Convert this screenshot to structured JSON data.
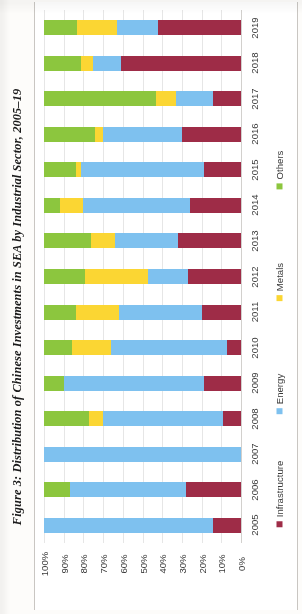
{
  "caption": "Figure 3: Distribution of Chinese Investments in SEA by Industrial Sector, 2005–19",
  "legend": {
    "position": "right-rotated",
    "items": [
      {
        "label": "Others",
        "color": "#8CC63E",
        "icon": "legend-swatch"
      },
      {
        "label": "Metals",
        "color": "#FBD633",
        "icon": "legend-swatch"
      },
      {
        "label": "Energy",
        "color": "#7EC1EF",
        "icon": "legend-swatch"
      },
      {
        "label": "Infrastructure",
        "color": "#9E2C47",
        "icon": "legend-swatch"
      }
    ]
  },
  "axis": {
    "percent_ticks": [
      "100%",
      "90%",
      "80%",
      "70%",
      "60%",
      "50%",
      "40%",
      "30%",
      "20%",
      "10%",
      "0%"
    ],
    "years": [
      "2019",
      "2018",
      "2017",
      "2016",
      "2015",
      "2014",
      "2013",
      "2012",
      "2011",
      "2010",
      "2009",
      "2008",
      "2007",
      "2006",
      "2005"
    ]
  },
  "chart_data": {
    "type": "bar",
    "orientation": "horizontal-stacked-100",
    "title": "Figure 3: Distribution of Chinese Investments in SEA by Industrial Sector, 2005–19",
    "xlabel": "",
    "ylabel": "",
    "xlim": [
      0,
      100
    ],
    "xtick_labels": [
      "100%",
      "90%",
      "80%",
      "70%",
      "60%",
      "50%",
      "40%",
      "30%",
      "20%",
      "10%",
      "0%"
    ],
    "x_axis_direction": "reversed (100% at left, 0% at right)",
    "grid": true,
    "legend_position": "right",
    "categories": [
      "2019",
      "2018",
      "2017",
      "2016",
      "2015",
      "2014",
      "2013",
      "2012",
      "2011",
      "2010",
      "2009",
      "2008",
      "2007",
      "2006",
      "2005"
    ],
    "series": [
      {
        "name": "Others",
        "color": "#8CC63E",
        "values": [
          17,
          19,
          57,
          26,
          16,
          8,
          24,
          21,
          16,
          14,
          10,
          23,
          0,
          13,
          0
        ]
      },
      {
        "name": "Metals",
        "color": "#FBD633",
        "values": [
          20,
          6,
          10,
          4,
          3,
          12,
          12,
          32,
          22,
          20,
          0,
          7,
          0,
          0,
          0
        ]
      },
      {
        "name": "Energy",
        "color": "#7EC1EF",
        "values": [
          21,
          14,
          19,
          40,
          62,
          54,
          32,
          20,
          42,
          59,
          71,
          61,
          100,
          59,
          86
        ]
      },
      {
        "name": "Infrastructure",
        "color": "#9E2C47",
        "values": [
          42,
          61,
          14,
          30,
          19,
          26,
          32,
          27,
          20,
          7,
          19,
          9,
          0,
          28,
          14
        ]
      }
    ]
  }
}
